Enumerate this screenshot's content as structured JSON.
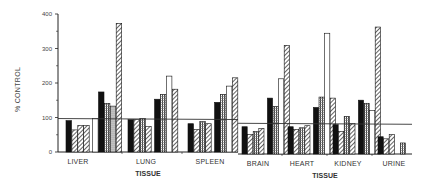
{
  "chart_data": {
    "type": "bar",
    "title": "",
    "ylabel": "% CONTROL",
    "xlabel": "TISSUE",
    "ylim": [
      0,
      400
    ],
    "yticks": [
      0,
      100,
      200,
      300,
      400
    ],
    "grid": false,
    "legend": null,
    "panels": [
      {
        "name": "left",
        "xlabel": "TISSUE",
        "reference_line": 97,
        "categories": [
          "LIVER",
          "LUNG",
          "SPLEEN"
        ],
        "groups": [
          {
            "category": "LIVER",
            "values": [
              91,
              64,
              77,
              77,
              97,
              174,
              141,
              133,
              373
            ],
            "patterns": [
              "solid",
              "diag",
              "diag",
              "diag",
              "open",
              "solid",
              "grid",
              "dots",
              "diag"
            ]
          },
          {
            "category": "LUNG",
            "values": [
              94,
              94,
              97,
              74,
              153,
              167,
              220,
              182
            ],
            "patterns": [
              "solid",
              "diag",
              "grid",
              "diag",
              "solid",
              "grid",
              "open",
              "diag"
            ]
          },
          {
            "category": "SPLEEN",
            "values": [
              82,
              65,
              88,
              82,
              144,
              167,
              191,
              215
            ],
            "patterns": [
              "solid",
              "diag",
              "grid",
              "diag",
              "solid",
              "grid",
              "open",
              "diag"
            ]
          }
        ]
      },
      {
        "name": "right",
        "xlabel": "TISSUE",
        "reference_line": 89,
        "categories": [
          "BRAIN",
          "HEART",
          "KIDNEY",
          "URINE"
        ],
        "groups": [
          {
            "category": "BRAIN",
            "values": [
              79,
              56,
              65,
              74,
              162,
              138,
              218,
              315
            ],
            "patterns": [
              "solid",
              "diag",
              "grid",
              "diag",
              "solid",
              "grid",
              "open",
              "diag"
            ]
          },
          {
            "category": "HEART",
            "values": [
              79,
              71,
              76,
              82,
              135,
              165,
              350,
              162
            ],
            "patterns": [
              "solid",
              "diag",
              "grid",
              "diag",
              "solid",
              "grid",
              "open",
              "diag"
            ]
          },
          {
            "category": "KIDNEY",
            "values": [
              85,
              65,
              109,
              88,
              156,
              147,
              126,
              368
            ],
            "patterns": [
              "solid",
              "diag",
              "grid",
              "diag",
              "solid",
              "grid",
              "open",
              "diag"
            ]
          },
          {
            "category": "URINE",
            "values": [
              50,
              44,
              56,
              0,
              32
            ],
            "patterns": [
              "solid",
              "diag",
              "diag",
              "none",
              "grid"
            ]
          }
        ]
      }
    ]
  },
  "labels": {
    "ylabel": "% CONTROL",
    "left_xlabel": "TISSUE",
    "right_xlabel": "TISSUE"
  }
}
